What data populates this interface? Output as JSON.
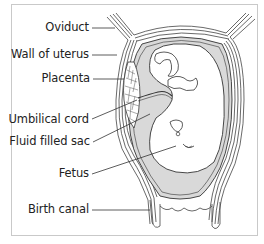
{
  "diagram": {
    "labels": [
      {
        "id": "oviduct",
        "text": "Oviduct"
      },
      {
        "id": "wall-of-uterus",
        "text": "Wall of uterus"
      },
      {
        "id": "placenta",
        "text": "Placenta"
      },
      {
        "id": "umbilical-cord",
        "text": "Umbilical cord"
      },
      {
        "id": "fluid-filled-sac",
        "text": "Fluid filled sac"
      },
      {
        "id": "fetus",
        "text": "Fetus"
      },
      {
        "id": "birth-canal",
        "text": "Birth canal"
      }
    ],
    "colors": {
      "line": "#333333",
      "sac_fill": "#d9d9d9",
      "wall_fill": "#ffffff",
      "frame": "#c9c9c9"
    }
  }
}
